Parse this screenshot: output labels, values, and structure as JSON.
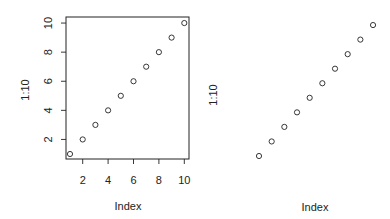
{
  "chart_data": [
    {
      "type": "scatter",
      "panel": "left",
      "title": "",
      "xlabel": "Index",
      "ylabel": "1:10",
      "x": [
        1,
        2,
        3,
        4,
        5,
        6,
        7,
        8,
        9,
        10
      ],
      "y": [
        1,
        2,
        3,
        4,
        5,
        6,
        7,
        8,
        9,
        10
      ],
      "xlim": [
        0.64,
        10.36
      ],
      "ylim": [
        0.64,
        10.36
      ],
      "x_ticks": [
        2,
        4,
        6,
        8,
        10
      ],
      "y_ticks": [
        2,
        4,
        6,
        8,
        10
      ],
      "box": true,
      "axes": true,
      "marker": "open-circle"
    },
    {
      "type": "scatter",
      "panel": "right",
      "title": "",
      "xlabel": "Index",
      "ylabel": "1:10",
      "x": [
        1,
        2,
        3,
        4,
        5,
        6,
        7,
        8,
        9,
        10
      ],
      "y": [
        1,
        2,
        3,
        4,
        5,
        6,
        7,
        8,
        9,
        10
      ],
      "box": false,
      "axes": false,
      "marker": "open-circle"
    }
  ],
  "left": {
    "xlabel": "Index",
    "ylabel": "1:10",
    "x_tick_labels": [
      "2",
      "4",
      "6",
      "8",
      "10"
    ],
    "y_tick_labels": [
      "2",
      "4",
      "6",
      "8",
      "10"
    ]
  },
  "right": {
    "xlabel": "Index",
    "ylabel": "1:10"
  }
}
